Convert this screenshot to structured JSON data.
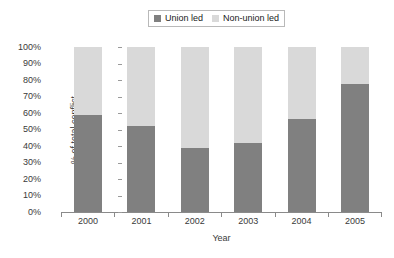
{
  "chart_data": {
    "type": "bar",
    "subtype": "stacked-100-percent",
    "title": "",
    "xlabel": "Year",
    "ylabel": "% of total conflict",
    "categories": [
      "2000",
      "2001",
      "2002",
      "2003",
      "2004",
      "2005"
    ],
    "series": [
      {
        "name": "Union led",
        "color": "#808080",
        "values": [
          59,
          52,
          39,
          42,
          56.5,
          77.5
        ]
      },
      {
        "name": "Non-union led",
        "color": "#d9d9d9",
        "values": [
          41,
          48,
          61,
          58,
          43.5,
          22.5
        ]
      }
    ],
    "ylim": [
      0,
      100
    ],
    "y_ticks": [
      "0%",
      "10%",
      "20%",
      "30%",
      "40%",
      "50%",
      "60%",
      "70%",
      "80%",
      "90%",
      "100%"
    ],
    "y_tick_values": [
      0,
      10,
      20,
      30,
      40,
      50,
      60,
      70,
      80,
      90,
      100
    ],
    "grid": false,
    "legend_position": "top-center",
    "legend_entries": [
      "Union led",
      "Non-union led"
    ]
  },
  "legend": {
    "entries": [
      {
        "label": "Union led",
        "swatch_name": "legend-swatch-union-led"
      },
      {
        "label": "Non-union led",
        "swatch_name": "legend-swatch-non-union-led"
      }
    ]
  },
  "axes": {
    "y_title": "% of total conflict",
    "x_title": "Year"
  },
  "colors": {
    "union_led": "#808080",
    "non_union_led": "#d9d9d9",
    "axis": "#8a8a8a",
    "text": "#3a3a3a",
    "legend_border": "#b9b9b9",
    "background": "#ffffff"
  }
}
